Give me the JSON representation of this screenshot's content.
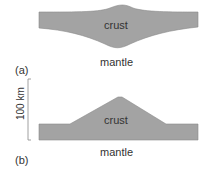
{
  "panels": [
    {
      "id": "a",
      "label": "(a)",
      "upper_layer": "crust",
      "lower_layer": "mantle",
      "description": "Crust thickened symmetrically with upward bulge and deeper downward root"
    },
    {
      "id": "b",
      "label": "(b)",
      "upper_layer": "crust",
      "lower_layer": "mantle",
      "description": "Crust thickened only upward, flat base"
    }
  ],
  "scale_bar": {
    "label": "100 km"
  },
  "colors": {
    "crust": "#a3a3a3",
    "crust_edge": "#7a7a7a",
    "mantle": "#ffffff"
  }
}
